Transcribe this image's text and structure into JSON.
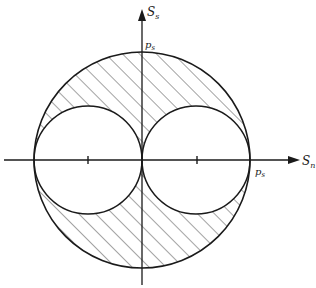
{
  "diagram": {
    "type": "stress-region-diagram",
    "colors": {
      "line": "#1a1a1a",
      "hatch": "#333333",
      "background": "#ffffff"
    },
    "axes": {
      "horizontal": {
        "label_main": "S",
        "label_sub": "n"
      },
      "vertical": {
        "label_main": "S",
        "label_sub": "s"
      }
    },
    "points": {
      "top": {
        "label_main": "p",
        "label_sub": "s"
      },
      "right": {
        "label_main": "p",
        "label_sub": "s"
      }
    },
    "regions": [
      {
        "name": "outer-circle",
        "radius": "p_s"
      },
      {
        "name": "left-inner-circle",
        "radius": "p_s/2",
        "center": "-p_s/2"
      },
      {
        "name": "right-inner-circle",
        "radius": "p_s/2",
        "center": "p_s/2"
      },
      {
        "name": "hatched-region",
        "fill": "hatched"
      }
    ]
  }
}
